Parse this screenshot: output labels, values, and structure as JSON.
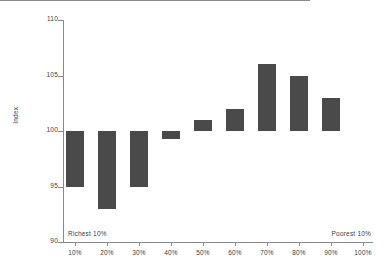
{
  "chart_data": {
    "type": "bar",
    "title": "",
    "subtitle": "",
    "xlabel": "",
    "ylabel": "Index",
    "categories": [
      "10%",
      "20%",
      "30%",
      "40%",
      "50%",
      "60%",
      "70%",
      "80%",
      "90%",
      "100%"
    ],
    "values": [
      95,
      93,
      95,
      99.3,
      101,
      102,
      106,
      105,
      103,
      null
    ],
    "baseline": 100,
    "ylim": [
      90,
      110
    ],
    "yticks": [
      90,
      95,
      100,
      105,
      110
    ],
    "ytick_labels": [
      "90",
      "95",
      "100",
      "105",
      "110"
    ],
    "xtick_labels": [
      "10%",
      "20%",
      "30%",
      "40%",
      "50%",
      "60%",
      "70%",
      "80%",
      "90%",
      "100%"
    ],
    "grid": false,
    "legend": null,
    "annotations": [
      {
        "text": "Richest 10%",
        "position": "bottom-left"
      },
      {
        "text": "Poorest 10%",
        "position": "bottom-right"
      }
    ],
    "colors": {
      "bar": "#4a4a4a",
      "axis": "#8a8a8a",
      "text": "#3d3d3d",
      "background": "#ffffff"
    }
  }
}
